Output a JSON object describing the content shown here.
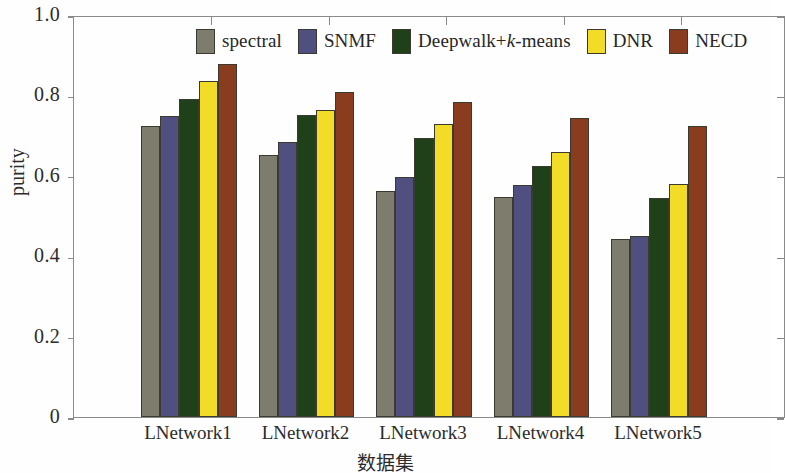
{
  "chart_data": {
    "type": "bar",
    "title": "",
    "xlabel": "数据集",
    "ylabel": "purity",
    "categories": [
      "LNetwork1",
      "LNetwork2",
      "LNetwork3",
      "LNetwork4",
      "LNetwork5"
    ],
    "series": [
      {
        "name": "spectral",
        "color": "#7e7c6c",
        "values": [
          0.725,
          0.652,
          0.562,
          0.547,
          0.443
        ]
      },
      {
        "name": "SNMF",
        "color": "#4f5080",
        "values": [
          0.75,
          0.683,
          0.597,
          0.577,
          0.45
        ]
      },
      {
        "name": "Deepwalk+k-means",
        "color": "#1f4018",
        "values": [
          0.79,
          0.752,
          0.695,
          0.625,
          0.545
        ]
      },
      {
        "name": "DNR",
        "color": "#f2dc28",
        "values": [
          0.835,
          0.763,
          0.728,
          0.66,
          0.58
        ]
      },
      {
        "name": "NECD",
        "color": "#8a3c1e",
        "values": [
          0.878,
          0.808,
          0.784,
          0.743,
          0.723
        ]
      }
    ],
    "ylim": [
      0,
      1.0
    ],
    "yticks": [
      0,
      0.2,
      0.4,
      0.6,
      0.8,
      1.0
    ],
    "ytick_labels": [
      "0",
      "0.2",
      "0.4",
      "0.6",
      "0.8",
      "1.0"
    ],
    "grid": false,
    "legend_position": "top-inside"
  },
  "legend": {
    "entries": [
      {
        "label": "spectral",
        "label_html": "spectral"
      },
      {
        "label": "SNMF",
        "label_html": "SNMF"
      },
      {
        "label": "Deepwalk+k-means",
        "label_html": "Deepwalk+<i>k</i>-means"
      },
      {
        "label": "DNR",
        "label_html": "DNR"
      },
      {
        "label": "NECD",
        "label_html": "NECD"
      }
    ]
  },
  "axes": {
    "y_title": "purity",
    "x_title": "数据集"
  }
}
